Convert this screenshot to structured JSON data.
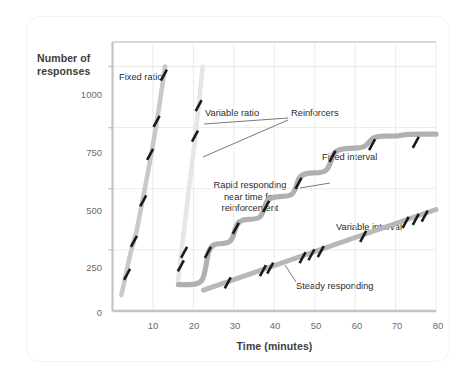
{
  "figure": {
    "background_color": "#ffffff",
    "frame_color": "#f2f2f2"
  },
  "chart_data": {
    "type": "line",
    "title": "",
    "xlabel": "Time (minutes)",
    "ylabel": "Number of responses",
    "xlim": [
      0,
      80
    ],
    "ylim": [
      0,
      1100
    ],
    "xticks": [
      "10",
      "20",
      "30",
      "40",
      "50",
      "60",
      "70",
      "80"
    ],
    "xtick_values": [
      10,
      20,
      30,
      40,
      50,
      60,
      70,
      80
    ],
    "yticks": [
      "0",
      "250",
      "500",
      "750",
      "1000"
    ],
    "ytick_values": [
      0,
      250,
      500,
      750,
      1000
    ],
    "grid": true,
    "legend_position": "inline-annotations",
    "series": [
      {
        "name": "Fixed ratio",
        "color": "#c9c9c9",
        "style": "steep-line",
        "points": [
          [
            2.2,
            65
          ],
          [
            4.5,
            240
          ],
          [
            6.0,
            330
          ],
          [
            8.0,
            500
          ],
          [
            9.8,
            660
          ],
          [
            11.5,
            830
          ],
          [
            13.0,
            1000
          ]
        ],
        "reinforcer_marks": [
          [
            3.6,
            150
          ],
          [
            5.3,
            285
          ],
          [
            7.6,
            450
          ],
          [
            9.3,
            640
          ],
          [
            10.9,
            775
          ],
          [
            12.7,
            965
          ]
        ]
      },
      {
        "name": "Variable ratio",
        "color": "#e6e6e6",
        "style": "steep-line",
        "points": [
          [
            16.2,
            120
          ],
          [
            17.6,
            320
          ],
          [
            19.2,
            540
          ],
          [
            20.8,
            760
          ],
          [
            22.3,
            1000
          ]
        ],
        "reinforcer_marks": [
          [
            16.9,
            185
          ],
          [
            17.7,
            240
          ],
          [
            20.4,
            715
          ],
          [
            21.3,
            840
          ]
        ]
      },
      {
        "name": "Fixed interval",
        "color": "#b0b0b0",
        "style": "staircase",
        "points": [
          [
            16.3,
            108
          ],
          [
            22.0,
            108
          ],
          [
            23.0,
            170
          ],
          [
            24.0,
            275
          ],
          [
            28.6,
            275
          ],
          [
            29.8,
            300
          ],
          [
            31.0,
            375
          ],
          [
            36.0,
            375
          ],
          [
            37.2,
            400
          ],
          [
            38.4,
            468
          ],
          [
            44.0,
            468
          ],
          [
            45.2,
            495
          ],
          [
            46.4,
            565
          ],
          [
            52.5,
            565
          ],
          [
            53.8,
            598
          ],
          [
            55.0,
            665
          ],
          [
            62.0,
            665
          ],
          [
            63.4,
            690
          ],
          [
            64.8,
            715
          ],
          [
            70.0,
            715
          ],
          [
            71.5,
            718
          ],
          [
            73.0,
            723
          ],
          [
            80.0,
            723
          ]
        ],
        "reinforcer_marks": [
          [
            23.6,
            240
          ],
          [
            30.5,
            338
          ],
          [
            38.0,
            428
          ],
          [
            46.0,
            522
          ],
          [
            54.4,
            632
          ],
          [
            64.2,
            680
          ],
          [
            75.0,
            690
          ]
        ]
      },
      {
        "name": "Variable interval",
        "color": "#b8b8b8",
        "style": "straight-line",
        "points": [
          [
            22.5,
            85
          ],
          [
            80.0,
            415
          ]
        ],
        "reinforcer_marks": [
          [
            28.5,
            115
          ],
          [
            37.2,
            165
          ],
          [
            39.0,
            175
          ],
          [
            47.0,
            218
          ],
          [
            49.2,
            230
          ],
          [
            51.5,
            243
          ],
          [
            62.0,
            305
          ],
          [
            72.5,
            362
          ],
          [
            75.0,
            375
          ],
          [
            77.2,
            388
          ]
        ]
      }
    ],
    "annotations": [
      {
        "id": "fixed-ratio-label",
        "text": "Fixed ratio",
        "x": 5.0,
        "y": 1065,
        "align": "left"
      },
      {
        "id": "variable-ratio-label",
        "text": "Variable ratio",
        "x": 23.8,
        "y": 908,
        "align": "left"
      },
      {
        "id": "reinforcers-label",
        "text": "Reinforcers",
        "x": 46.5,
        "y": 908,
        "align": "left"
      },
      {
        "id": "fixed-interval-label",
        "text": "Fixed interval",
        "x": 52.5,
        "y": 670,
        "align": "left"
      },
      {
        "id": "rapid-responding-label",
        "text": "Rapid responding\nnear time for\nreinforcement",
        "x": 34.0,
        "y": 580,
        "align": "center"
      },
      {
        "id": "variable-interval-label",
        "text": "Variable interval",
        "x": 55.5,
        "y": 432,
        "align": "left"
      },
      {
        "id": "steady-responding-label",
        "text": "Steady responding",
        "x": 46.0,
        "y": 130,
        "align": "left"
      }
    ]
  }
}
